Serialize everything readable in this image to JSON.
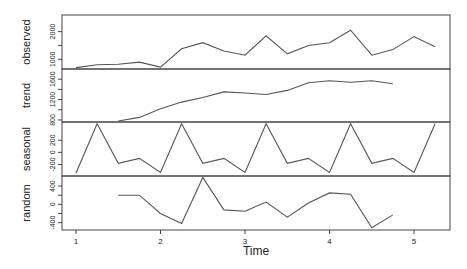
{
  "chart_data": {
    "type": "line",
    "title": "",
    "xlabel": "Time",
    "x_ticks": [
      "1",
      "2",
      "3",
      "4",
      "5"
    ],
    "x_range": [
      0.9,
      5.35
    ],
    "x": [
      1.0,
      1.25,
      1.5,
      1.75,
      2.0,
      2.25,
      2.5,
      2.75,
      3.0,
      3.25,
      3.5,
      3.75,
      4.0,
      4.25,
      4.5,
      4.75,
      5.0,
      5.25
    ],
    "panels": [
      {
        "name": "observed",
        "ylabel": "observed",
        "y_ticks": [
          "1000",
          "2000"
        ],
        "y_tick_values": [
          1000,
          1500,
          2000
        ],
        "ylim": [
          650,
          2600
        ],
        "values": [
          700,
          800,
          820,
          900,
          720,
          1380,
          1600,
          1300,
          1150,
          1850,
          1200,
          1500,
          1600,
          2050,
          1150,
          1350,
          1820,
          1450
        ]
      },
      {
        "name": "trend",
        "ylabel": "trend",
        "y_ticks": [
          "800",
          "1200",
          "1600"
        ],
        "y_tick_values": [
          800,
          1000,
          1200,
          1400,
          1600
        ],
        "ylim": [
          760,
          1800
        ],
        "values": [
          null,
          null,
          780,
          850,
          1020,
          1150,
          1240,
          1350,
          1330,
          1300,
          1380,
          1530,
          1570,
          1540,
          1570,
          1510,
          null,
          null
        ]
      },
      {
        "name": "seasonal",
        "ylabel": "seasonal",
        "y_ticks": [
          "-200",
          "0",
          "200"
        ],
        "y_tick_values": [
          -200,
          0,
          200
        ],
        "ylim": [
          -390,
          500
        ],
        "values": [
          -340,
          470,
          -180,
          -100,
          -330,
          470,
          -180,
          -100,
          -330,
          470,
          -180,
          -100,
          -330,
          470,
          -180,
          -100,
          -330,
          470
        ]
      },
      {
        "name": "random",
        "ylabel": "random",
        "y_ticks": [
          "-400",
          "0",
          "400"
        ],
        "y_tick_values": [
          -400,
          -200,
          0,
          200,
          400
        ],
        "ylim": [
          -560,
          620
        ],
        "values": [
          null,
          null,
          200,
          200,
          -200,
          -420,
          590,
          -120,
          -150,
          50,
          -280,
          30,
          250,
          220,
          -510,
          -230,
          null,
          null
        ]
      }
    ],
    "grid": false,
    "legend": null
  }
}
